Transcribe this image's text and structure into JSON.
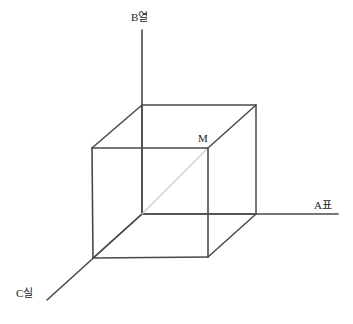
{
  "figure": {
    "background_color": "#ffffff",
    "edge_color": "#4a4a4a",
    "axis_color": "#4a4a4a",
    "diagonal_color": "#c9c9c9",
    "label_color": "#1d1d1d",
    "width": 353,
    "height": 324
  },
  "axes": {
    "b": {
      "label": "B열",
      "name": "b-axis",
      "direction": "vertical-up",
      "from": [
        142,
        214
      ],
      "to": [
        142,
        30
      ]
    },
    "a": {
      "label": "A표",
      "name": "a-axis",
      "direction": "horizontal-right",
      "from": [
        142,
        214
      ],
      "to": [
        338,
        214
      ]
    },
    "c": {
      "label": "C실",
      "name": "c-axis",
      "direction": "diagonal-down-left",
      "from": [
        142,
        214
      ],
      "to": [
        47,
        300
      ]
    }
  },
  "vertices": {
    "m": {
      "label": "M",
      "point": [
        208,
        148
      ],
      "description": "front-top-right cube vertex"
    },
    "origin": {
      "label": "",
      "point": [
        142,
        214
      ],
      "description": "axes origin / back-bottom-left cube vertex"
    }
  },
  "cube": {
    "front_face": [
      [
        92,
        148
      ],
      [
        208,
        148
      ],
      [
        208,
        257
      ],
      [
        93,
        258
      ]
    ],
    "back_face": [
      [
        142,
        105
      ],
      [
        256,
        105
      ],
      [
        256,
        214
      ],
      [
        142,
        214
      ]
    ],
    "connectors": [
      [
        [
          92,
          148
        ],
        [
          142,
          105
        ]
      ],
      [
        [
          208,
          148
        ],
        [
          256,
          105
        ]
      ],
      [
        [
          208,
          257
        ],
        [
          256,
          214
        ]
      ],
      [
        [
          93,
          258
        ],
        [
          142,
          214
        ]
      ]
    ]
  },
  "diagonal": {
    "name": "space-diagonal-origin-to-m",
    "from": [
      142,
      214
    ],
    "to": [
      208,
      148
    ]
  }
}
